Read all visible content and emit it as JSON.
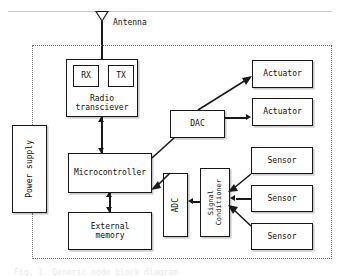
{
  "figure": {
    "type": "block-diagram",
    "boundary_label": "",
    "caption": "Fig. 1. Generic node block diagram"
  },
  "antenna": {
    "label": "Antenna",
    "icon": "antenna-triangle-icon"
  },
  "blocks": {
    "radio_transceiver": {
      "label_line1": "Radio",
      "label_line2": "transciever"
    },
    "rx": {
      "label": "RX"
    },
    "tx": {
      "label": "TX"
    },
    "power_supply": {
      "label": "Power supply"
    },
    "microcontroller": {
      "label": "Microcontroller"
    },
    "external_memory": {
      "label_line1": "External",
      "label_line2": "memory"
    },
    "dac": {
      "label": "DAC"
    },
    "adc": {
      "label": "ADC"
    },
    "signal_conditioner": {
      "label_line1": "Signal",
      "label_line2": "Conditioner"
    },
    "actuator_1": {
      "label": "Actuator"
    },
    "actuator_2": {
      "label": "Actuator"
    },
    "sensor_1": {
      "label": "Sensor"
    },
    "sensor_2": {
      "label": "Sensor"
    },
    "sensor_3": {
      "label": "Sensor"
    }
  },
  "colors": {
    "background": "#ffffff",
    "stroke": "#1a1a1a",
    "boundary_dotted": "#6b6b6b",
    "power_dotted": "#7a7a7a",
    "top_rule": "#c9c9c9",
    "text": "#111111"
  }
}
